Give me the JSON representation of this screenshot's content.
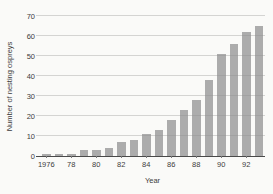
{
  "chart_data": {
    "type": "bar",
    "title": "",
    "xlabel": "Year",
    "ylabel": "Number of nesting ospreys",
    "x": [
      1976,
      1977,
      1978,
      1979,
      1980,
      1981,
      1982,
      1983,
      1984,
      1985,
      1986,
      1987,
      1988,
      1989,
      1990,
      1991,
      1992,
      1993
    ],
    "values": [
      1,
      1,
      1,
      3,
      3,
      4,
      7,
      8,
      11,
      13,
      18,
      23,
      28,
      38,
      51,
      56,
      62,
      65
    ],
    "ylim": [
      0,
      70
    ],
    "ytick_interval": 10,
    "ytick_labels": [
      "0",
      "10",
      "20",
      "30",
      "40",
      "50",
      "60",
      "70"
    ],
    "xtick_years": [
      1976,
      1978,
      1980,
      1982,
      1984,
      1986,
      1988,
      1990,
      1992
    ],
    "xtick_labels": [
      "1976",
      "78",
      "80",
      "82",
      "84",
      "86",
      "88",
      "90",
      "92"
    ],
    "grid": "horizontal",
    "legend": "none",
    "bar_color": "#acacac",
    "gridline_color": "#c8c8c8",
    "axis_color": "#4a4a4a",
    "text_color": "#3c3c3c",
    "background_color": "#fafaf8"
  }
}
